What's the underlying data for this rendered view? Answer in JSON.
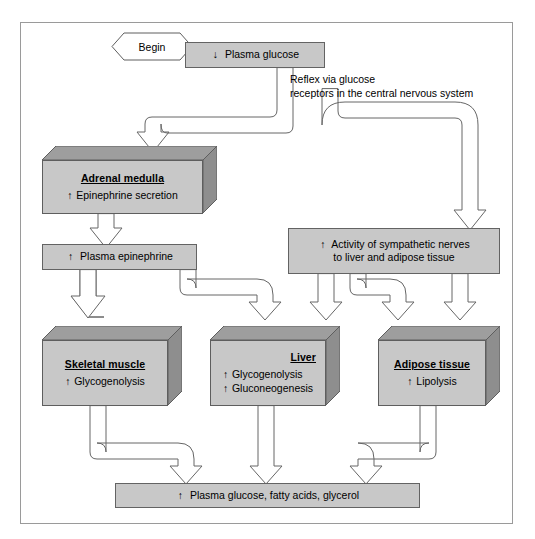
{
  "diagram": {
    "frame_color": "#9a9a9a",
    "box_fill": "#c8c8c8",
    "box_top_fill": "#9e9e9e",
    "box_side_fill": "#8e8e8e",
    "begin": {
      "label": "Begin",
      "shape": "hexagon"
    },
    "nodes": [
      {
        "id": "plasma-glucose",
        "kind": "flat",
        "arrow": "↓",
        "text": "Plasma glucose"
      },
      {
        "id": "adrenal-medulla",
        "kind": "box3d",
        "title": "Adrenal medulla",
        "lines": [
          {
            "arrow": "↑",
            "text": "Epinephrine secretion"
          }
        ]
      },
      {
        "id": "plasma-epinephrine",
        "kind": "flat",
        "arrow": "↑",
        "text": "Plasma epinephrine"
      },
      {
        "id": "sympathetic-nerves",
        "kind": "flat",
        "arrow": "↑",
        "text": "Activity of sympathetic nerves",
        "text2": "to liver and adipose tissue"
      },
      {
        "id": "skeletal-muscle",
        "kind": "box3d",
        "title": "Skeletal muscle",
        "lines": [
          {
            "arrow": "↑",
            "text": "Glycogenolysis"
          }
        ]
      },
      {
        "id": "liver",
        "kind": "box3d",
        "title": "Liver",
        "lines": [
          {
            "arrow": "↑",
            "text": "Glycogenolysis"
          },
          {
            "arrow": "↑",
            "text": "Gluconeogenesis"
          }
        ]
      },
      {
        "id": "adipose-tissue",
        "kind": "box3d",
        "title": "Adipose tissue",
        "lines": [
          {
            "arrow": "↑",
            "text": "Lipolysis"
          }
        ]
      },
      {
        "id": "result",
        "kind": "flat",
        "arrow": "↑",
        "text": "Plasma glucose, fatty acids, glycerol"
      }
    ],
    "annotations": [
      {
        "id": "reflex-note",
        "text": "Reflex via glucose\nreceptors in the central nervous system"
      }
    ]
  }
}
